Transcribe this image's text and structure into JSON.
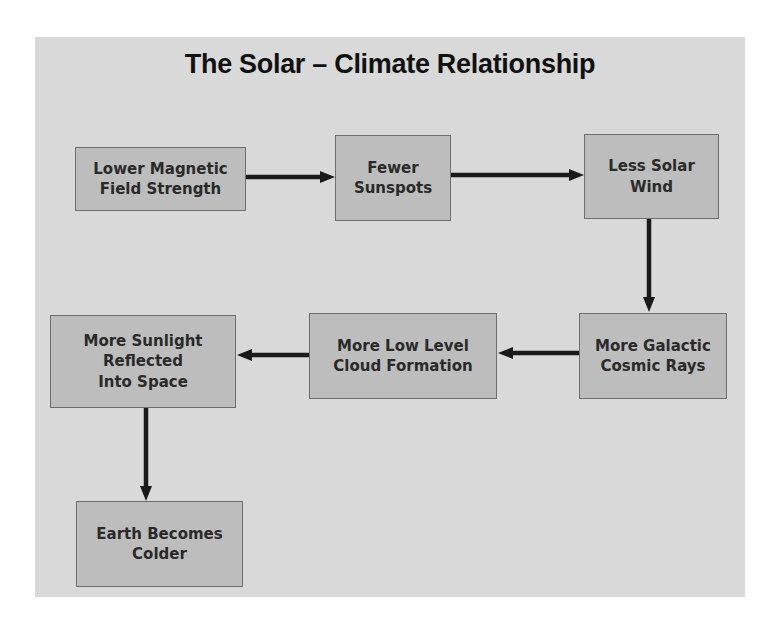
{
  "slide": {
    "title": "The Solar – Climate Relationship"
  },
  "nodes": [
    {
      "id": "lower-magnetic-field",
      "lines": [
        "Lower Magnetic",
        "Field Strength"
      ]
    },
    {
      "id": "fewer-sunspots",
      "lines": [
        "Fewer",
        "Sunspots"
      ]
    },
    {
      "id": "less-solar-wind",
      "lines": [
        "Less Solar",
        "Wind"
      ]
    },
    {
      "id": "more-cosmic-rays",
      "lines": [
        "More Galactic",
        "Cosmic Rays"
      ]
    },
    {
      "id": "more-cloud-formation",
      "lines": [
        "More Low Level",
        "Cloud Formation"
      ]
    },
    {
      "id": "more-sunlight-reflected",
      "lines": [
        "More Sunlight",
        "Reflected",
        "Into Space"
      ]
    },
    {
      "id": "earth-colder",
      "lines": [
        "Earth Becomes",
        "Colder"
      ]
    }
  ],
  "edges": [
    {
      "from": "lower-magnetic-field",
      "to": "fewer-sunspots",
      "direction": "right"
    },
    {
      "from": "fewer-sunspots",
      "to": "less-solar-wind",
      "direction": "right"
    },
    {
      "from": "less-solar-wind",
      "to": "more-cosmic-rays",
      "direction": "down"
    },
    {
      "from": "more-cosmic-rays",
      "to": "more-cloud-formation",
      "direction": "left"
    },
    {
      "from": "more-cloud-formation",
      "to": "more-sunlight-reflected",
      "direction": "left"
    },
    {
      "from": "more-sunlight-reflected",
      "to": "earth-colder",
      "direction": "down"
    }
  ],
  "colors": {
    "slide_bg": "#d9d9d9",
    "box_fill": "#bdbdbd",
    "box_border": "#6e6e6e",
    "arrow": "#1a1a1a",
    "text": "#2a2a2a"
  }
}
